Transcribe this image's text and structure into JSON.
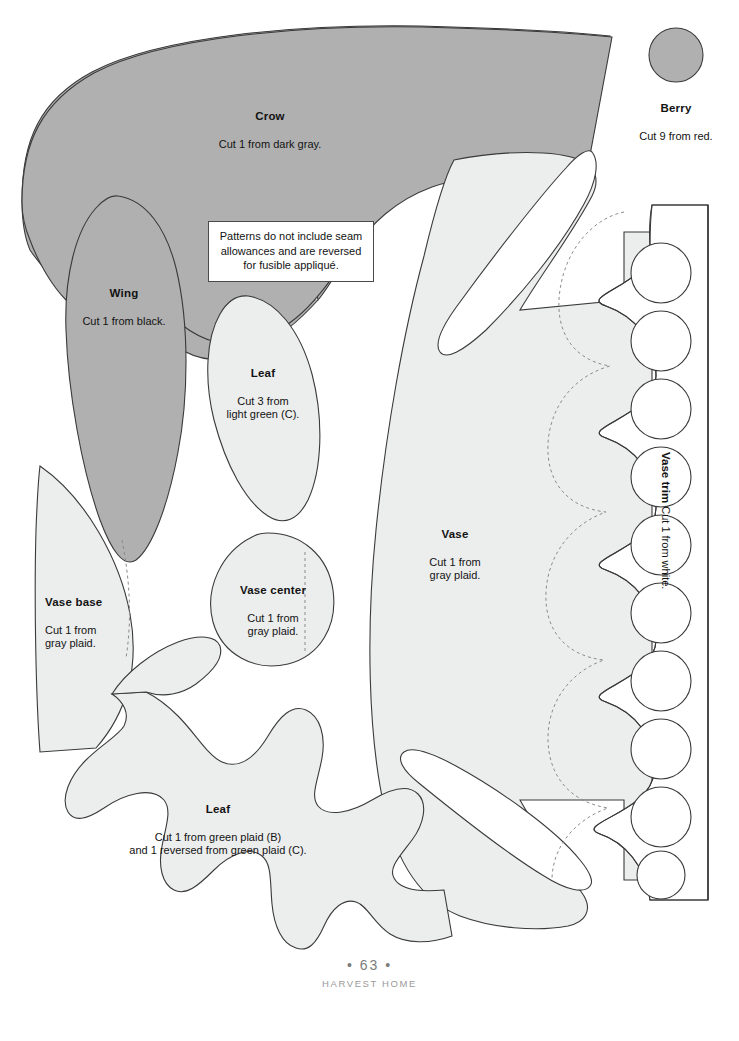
{
  "page": {
    "page_number": "63",
    "book_title": "HARVEST HOME",
    "page_marker_left": "•",
    "page_marker_right": "•"
  },
  "note": {
    "line1": "Patterns do not include seam",
    "line2": "allowances and are reversed",
    "line3": "for fusible appliqué."
  },
  "colors": {
    "page_background": "#ffffff",
    "dark_gray_piece": "#b0b0b0",
    "light_gray_piece": "#eceded",
    "outline": "#3a3a3a",
    "dashed_line": "#8b8b8b",
    "text": "#131313",
    "footer_text": "#8d8d8d"
  },
  "pieces": [
    {
      "id": "crow",
      "title": "Crow",
      "sub": "Cut 1 from dark gray.",
      "fill": "dark-gray",
      "align": "center"
    },
    {
      "id": "berry",
      "title": "Berry",
      "sub": "Cut 9 from red.",
      "fill": "dark-gray",
      "align": "center"
    },
    {
      "id": "wing",
      "title": "Wing",
      "sub": "Cut 1 from black.",
      "fill": "dark-gray",
      "align": "center"
    },
    {
      "id": "leaf-small",
      "title": "Leaf",
      "sub": "Cut 3 from\nlight green (C).",
      "fill": "light-gray",
      "align": "center"
    },
    {
      "id": "vase",
      "title": "Vase",
      "sub": "Cut 1 from\ngray plaid.",
      "fill": "light-gray",
      "align": "center"
    },
    {
      "id": "vase-base",
      "title": "Vase base",
      "sub": "Cut 1 from\ngray plaid.",
      "fill": "light-gray",
      "align": "left"
    },
    {
      "id": "vase-center",
      "title": "Vase center",
      "sub": "Cut 1 from\ngray plaid.",
      "fill": "light-gray",
      "align": "center"
    },
    {
      "id": "leaf-large",
      "title": "Leaf",
      "sub": "Cut 1 from green plaid (B)\nand 1 reversed from green plaid (C).",
      "fill": "light-gray",
      "align": "center"
    },
    {
      "id": "vase-trim",
      "title": "Vase trim",
      "sub": "Cut 1 from white.",
      "fill": "none",
      "align": "vertical"
    }
  ]
}
